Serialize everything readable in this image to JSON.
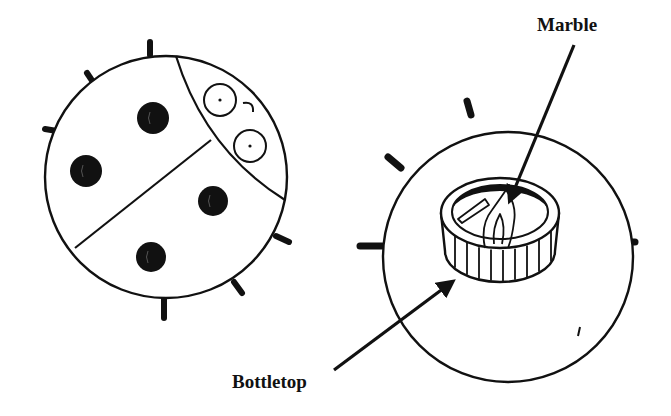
{
  "diagram": {
    "type": "illustration",
    "stroke_color": "#111111",
    "background": "#ffffff",
    "labels": {
      "marble": "Marble",
      "bottletop": "Bottletop"
    },
    "ladybug_top": {
      "body": {
        "cx": 166,
        "cy": 177,
        "r": 121
      },
      "head_arc": "M 176 56 Q 205 150 285 200",
      "wing_divider": "M 75 248 L 211 140",
      "eyes": [
        {
          "cx": 220,
          "cy": 100,
          "r": 16
        },
        {
          "cx": 250,
          "cy": 146,
          "r": 16
        }
      ],
      "mouth": "M 243 103 Q 254 101 253 112",
      "spots": [
        {
          "cx": 153,
          "cy": 118,
          "r": 16
        },
        {
          "cx": 86,
          "cy": 171,
          "r": 16
        },
        {
          "cx": 213,
          "cy": 201,
          "r": 15
        },
        {
          "cx": 151,
          "cy": 257,
          "r": 15
        }
      ],
      "legs": [
        {
          "x1": 150,
          "y1": 55,
          "x2": 150,
          "y2": 42
        },
        {
          "x1": 93,
          "y1": 82,
          "x2": 87,
          "y2": 73
        },
        {
          "x1": 57,
          "y1": 131,
          "x2": 45,
          "y2": 129
        },
        {
          "x1": 276,
          "y1": 236,
          "x2": 289,
          "y2": 242
        },
        {
          "x1": 234,
          "y1": 282,
          "x2": 242,
          "y2": 293
        },
        {
          "x1": 164,
          "y1": 299,
          "x2": 164,
          "y2": 318
        }
      ]
    },
    "ladybug_bottom": {
      "body": {
        "cx": 508,
        "cy": 257,
        "r": 125
      },
      "legs": [
        {
          "x1": 471,
          "y1": 115,
          "x2": 467,
          "y2": 101
        },
        {
          "x1": 401,
          "y1": 168,
          "x2": 388,
          "y2": 157
        },
        {
          "x1": 382,
          "y1": 246,
          "x2": 360,
          "y2": 246
        },
        {
          "x1": 630,
          "y1": 242,
          "x2": 635,
          "y2": 242
        },
        {
          "x1": 595,
          "y1": 306,
          "x2": 608,
          "y2": 319
        },
        {
          "x1": 539,
          "y1": 355,
          "x2": 541,
          "y2": 371
        }
      ],
      "tick": "M 580 327 L 578 336",
      "bottletop": {
        "top_ellipse": {
          "cx": 500,
          "cy": 213,
          "rx": 59,
          "ry": 35
        },
        "inner_ellipse": {
          "cx": 500,
          "cy": 212,
          "rx": 48,
          "ry": 27
        },
        "side_height": 38,
        "ridges_x": [
          455,
          467,
          479,
          491,
          503,
          515,
          527,
          539,
          551
        ]
      },
      "marble_shapes": [
        "M 458 219 L 485 199 L 489 205 L 462 223 Z",
        "M 485 248 Q 480 225 492 210 Q 502 196 506 190 Q 517 205 514 222 Q 512 238 508 248",
        "M 494 244 Q 492 228 500 214 Q 506 226 502 244"
      ]
    },
    "arrows": [
      {
        "name": "marble-arrow",
        "x1": 574,
        "y1": 45,
        "x2": 510,
        "y2": 200
      },
      {
        "name": "bottletop-arrow",
        "x1": 334,
        "y1": 370,
        "x2": 452,
        "y2": 282
      }
    ]
  }
}
